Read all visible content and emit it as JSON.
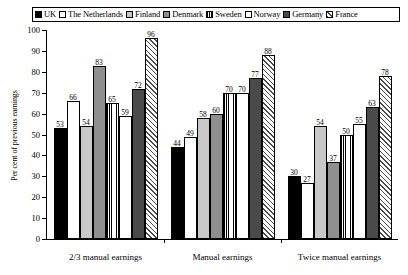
{
  "legend": {
    "items": [
      {
        "label": "UK",
        "pattern": "solid-black",
        "color": "#000000"
      },
      {
        "label": "The Netherlands",
        "pattern": "white",
        "color": "#ffffff"
      },
      {
        "label": "Finland",
        "pattern": "gray-light",
        "color": "#c8c8c8"
      },
      {
        "label": "Denmark",
        "pattern": "gray-mid",
        "color": "#8f8f8f"
      },
      {
        "label": "Sweden",
        "pattern": "vstripe",
        "color": "#ffffff"
      },
      {
        "label": "Norway",
        "pattern": "white",
        "color": "#ffffff"
      },
      {
        "label": "Germany",
        "pattern": "gray-dark",
        "color": "#4a4a4a"
      },
      {
        "label": "France",
        "pattern": "diag",
        "color": "#4a4a4a"
      }
    ]
  },
  "axis": {
    "y_title": "Per cent of previous earnings",
    "y_ticks": [
      "0",
      "10",
      "20",
      "30",
      "40",
      "50",
      "60",
      "70",
      "80",
      "90",
      "100"
    ]
  },
  "chart_data": {
    "type": "bar",
    "title": "",
    "xlabel": "",
    "ylabel": "Per cent of previous earnings",
    "ylim": [
      0,
      100
    ],
    "ytick_step": 10,
    "grid": false,
    "legend_position": "top",
    "categories": [
      "2/3 manual earnings",
      "Manual earnings",
      "Twice manual earnings"
    ],
    "series": [
      {
        "name": "UK",
        "values": [
          53,
          44,
          30
        ]
      },
      {
        "name": "The Netherlands",
        "values": [
          66,
          49,
          27
        ]
      },
      {
        "name": "Finland",
        "values": [
          54,
          58,
          54
        ]
      },
      {
        "name": "Denmark",
        "values": [
          83,
          60,
          37
        ]
      },
      {
        "name": "Sweden",
        "values": [
          65,
          70,
          50
        ]
      },
      {
        "name": "Norway",
        "values": [
          59,
          70,
          55
        ]
      },
      {
        "name": "Germany",
        "values": [
          72,
          77,
          63
        ]
      },
      {
        "name": "France",
        "values": [
          96,
          88,
          78
        ]
      }
    ]
  }
}
